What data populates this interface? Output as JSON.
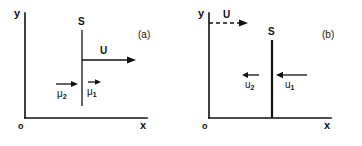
{
  "figure": {
    "type": "physics-diagram",
    "background_color": "#ffffff",
    "ink_color": "#111111",
    "panels": [
      {
        "id": "a",
        "label": "(a)",
        "axes": {
          "y_label": "y",
          "x_label": "x",
          "origin_label": "o"
        },
        "surface": {
          "label": "S",
          "style": "thin",
          "orientation": "vertical",
          "touches_x_axis": false
        },
        "vectors": [
          {
            "name": "U",
            "label": "U",
            "direction": "right",
            "style": "solid",
            "length": "long",
            "anchor": "surface"
          },
          {
            "name": "mu2",
            "label": "μ",
            "subscript": "2",
            "direction": "right",
            "style": "solid",
            "length": "medium",
            "side": "left-of-surface"
          },
          {
            "name": "mu1",
            "label": "μ",
            "subscript": "1",
            "direction": "right",
            "style": "solid",
            "length": "short",
            "side": "right-of-surface"
          }
        ]
      },
      {
        "id": "b",
        "label": "(b)",
        "axes": {
          "y_label": "y",
          "x_label": "x",
          "origin_label": "o"
        },
        "surface": {
          "label": "S",
          "style": "thick",
          "orientation": "vertical",
          "touches_x_axis": true
        },
        "vectors": [
          {
            "name": "U",
            "label": "U",
            "direction": "right",
            "style": "dashed",
            "length": "medium",
            "anchor": "y-axis"
          },
          {
            "name": "u2",
            "label": "u",
            "subscript": "2",
            "direction": "left",
            "style": "solid",
            "length": "short",
            "side": "left-of-surface"
          },
          {
            "name": "u1",
            "label": "u",
            "subscript": "1",
            "direction": "left",
            "style": "solid",
            "length": "medium",
            "side": "right-of-surface"
          }
        ]
      }
    ]
  }
}
